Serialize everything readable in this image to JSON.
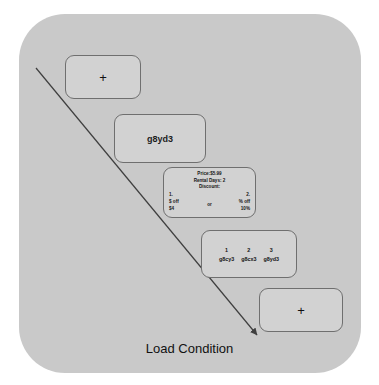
{
  "figure": {
    "caption": "Load Condition",
    "panel_color": "#c9c9c9",
    "card_color": "#d2d2d2",
    "card_border_color": "#6f6f6f",
    "arrow_color": "#3f3f3f",
    "arrow_label": "load-increase-arrow"
  },
  "cards": {
    "fixation_start": {
      "name": "fixation-cross-start",
      "symbol": "+"
    },
    "word": {
      "name": "word-stimulus",
      "text": "g8yd3"
    },
    "offer": {
      "name": "offer-details",
      "price_line": "Price:$5.99",
      "rental_line": "Rental Days: 2",
      "discount_line": "Discount:",
      "option_1": {
        "number": "1.",
        "type": "$ off",
        "value": "$4"
      },
      "conjunction": "or",
      "option_2": {
        "number": "2.",
        "type": "% off",
        "value": "10%"
      }
    },
    "choices": {
      "name": "code-choice-set",
      "items": [
        {
          "number": "1",
          "code": "g8cy3"
        },
        {
          "number": "2",
          "code": "g8cx3"
        },
        {
          "number": "3",
          "code": "g8yd3"
        }
      ]
    },
    "fixation_end": {
      "name": "fixation-cross-end",
      "symbol": "+"
    }
  }
}
